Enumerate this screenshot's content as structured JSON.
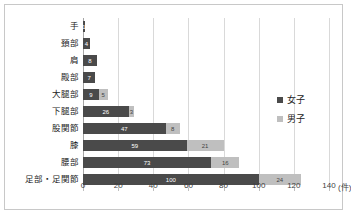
{
  "chart_data": {
    "type": "bar",
    "orientation": "horizontal",
    "stacked": true,
    "title": "",
    "xlabel": "",
    "ylabel": "",
    "unit_label": "(件)",
    "xlim": [
      0,
      140
    ],
    "xticks": [
      0,
      20,
      40,
      60,
      80,
      100,
      120,
      140
    ],
    "xtick_labels": [
      "0",
      "20",
      "40",
      "60",
      "80",
      "100",
      "120",
      "140"
    ],
    "grid": true,
    "legend_position": "right",
    "categories": [
      "手",
      "頚部",
      "肩",
      "殿部",
      "大腿部",
      "下腿部",
      "股関節",
      "膝",
      "腰部",
      "足部・足関節"
    ],
    "series": [
      {
        "name": "女子",
        "color": "#4a4a4a",
        "values": [
          1,
          4,
          8,
          7,
          9,
          26,
          47,
          59,
          73,
          100
        ]
      },
      {
        "name": "男子",
        "color": "#bfbfbf",
        "values": [
          0,
          0,
          0,
          0,
          5,
          3,
          8,
          21,
          16,
          24
        ]
      }
    ]
  },
  "legend": {
    "items": [
      {
        "label": "女子",
        "swatch": "female"
      },
      {
        "label": "男子",
        "swatch": "male"
      }
    ]
  }
}
